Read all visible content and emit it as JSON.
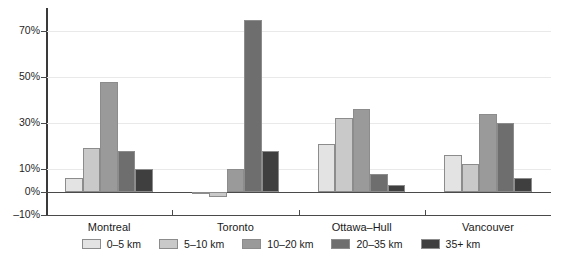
{
  "chart_data": {
    "type": "bar",
    "title": "",
    "subtitle": "",
    "xlabel": "",
    "ylabel": "",
    "categories": [
      "Montreal",
      "Toronto",
      "Ottawa–Hull",
      "Vancouver"
    ],
    "series": [
      {
        "name": "0–5 km",
        "color": "#e3e3e3",
        "values": [
          6,
          -0.5,
          21,
          16
        ]
      },
      {
        "name": "5–10 km",
        "color": "#c9c9c9",
        "values": [
          19,
          -2,
          32,
          12
        ]
      },
      {
        "name": "10–20 km",
        "color": "#9a9a9a",
        "values": [
          48,
          10,
          36,
          34
        ]
      },
      {
        "name": "20–35 km",
        "color": "#6e6e6e",
        "values": [
          18,
          75,
          8,
          30
        ]
      },
      {
        "name": "35+ km",
        "color": "#3f3f3f",
        "values": [
          10,
          18,
          3,
          6
        ]
      }
    ],
    "ylim": [
      -10,
      80
    ],
    "yticks": [
      -10,
      0,
      10,
      30,
      50,
      70
    ],
    "ytick_labels": [
      "–10%",
      "0%",
      "10%",
      "30%",
      "50%",
      "70%"
    ],
    "grid": true,
    "grid_values": [
      10,
      30,
      50,
      70
    ],
    "legend_position": "bottom",
    "value_suffix": "%"
  }
}
